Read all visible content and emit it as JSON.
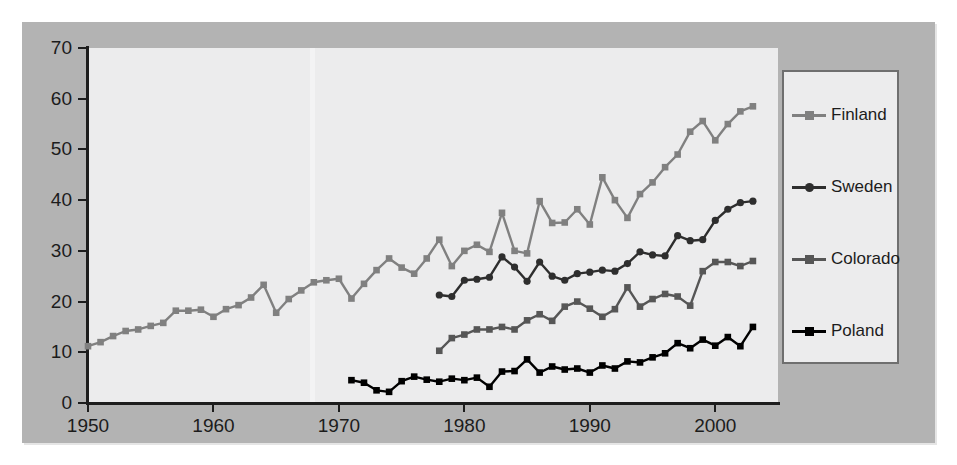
{
  "chart_data": {
    "type": "line",
    "title": "",
    "xlabel": "",
    "ylabel": "",
    "xlim": [
      1950,
      2005
    ],
    "ylim": [
      0,
      70
    ],
    "xticks": [
      1950,
      1960,
      1970,
      1980,
      1990,
      2000
    ],
    "yticks": [
      0,
      10,
      20,
      30,
      40,
      50,
      60,
      70
    ],
    "grid": false,
    "legend_position": "right",
    "colors": {
      "finland": "#808080",
      "sweden": "#2e2e2e",
      "colorado": "#565656",
      "poland": "#000000",
      "panel_background": "#ececed",
      "card_background": "#b3b3b3",
      "axis": "#1d1d1d",
      "text": "#1c1c1c"
    },
    "series": [
      {
        "name": "Finland",
        "marker": "square",
        "color": "#808080",
        "x": [
          1950,
          1951,
          1952,
          1953,
          1954,
          1955,
          1956,
          1957,
          1958,
          1959,
          1960,
          1961,
          1962,
          1963,
          1964,
          1965,
          1966,
          1967,
          1968,
          1969,
          1970,
          1971,
          1972,
          1973,
          1974,
          1975,
          1976,
          1977,
          1978,
          1979,
          1980,
          1981,
          1982,
          1983,
          1984,
          1985,
          1986,
          1987,
          1988,
          1989,
          1990,
          1991,
          1992,
          1993,
          1994,
          1995,
          1996,
          1997,
          1998,
          1999,
          2000,
          2001,
          2002,
          2003
        ],
        "values": [
          11.2,
          12.0,
          13.2,
          14.2,
          14.5,
          15.2,
          15.8,
          18.2,
          18.2,
          18.4,
          17.0,
          18.5,
          19.3,
          20.8,
          23.3,
          17.8,
          20.5,
          22.2,
          23.8,
          24.2,
          24.5,
          20.6,
          23.5,
          26.2,
          28.5,
          26.7,
          25.5,
          28.5,
          32.2,
          27.0,
          30.0,
          31.2,
          29.8,
          37.5,
          30.0,
          29.5,
          39.8,
          35.5,
          35.6,
          38.2,
          35.2,
          44.5,
          40.0,
          36.5,
          41.2,
          43.5,
          46.5,
          49.0,
          53.5,
          55.6,
          51.8,
          55.0,
          57.5,
          58.5
        ]
      },
      {
        "name": "Sweden",
        "marker": "circle",
        "color": "#2e2e2e",
        "x": [
          1978,
          1979,
          1980,
          1981,
          1982,
          1983,
          1984,
          1985,
          1986,
          1987,
          1988,
          1989,
          1990,
          1991,
          1992,
          1993,
          1994,
          1995,
          1996,
          1997,
          1998,
          1999,
          2000,
          2001,
          2002,
          2003
        ],
        "values": [
          21.3,
          21.0,
          24.2,
          24.4,
          24.8,
          28.8,
          26.8,
          24.0,
          27.8,
          25.0,
          24.2,
          25.5,
          25.8,
          26.2,
          26.0,
          27.5,
          29.8,
          29.2,
          29.0,
          33.0,
          32.0,
          32.2,
          36.0,
          38.2,
          39.5,
          39.8
        ]
      },
      {
        "name": "Colorado",
        "marker": "square",
        "color": "#565656",
        "x": [
          1978,
          1979,
          1980,
          1981,
          1982,
          1983,
          1984,
          1985,
          1986,
          1987,
          1988,
          1989,
          1990,
          1991,
          1992,
          1993,
          1994,
          1995,
          1996,
          1997,
          1998,
          1999,
          2000,
          2001,
          2002,
          2003
        ],
        "values": [
          10.3,
          12.8,
          13.5,
          14.5,
          14.5,
          15.0,
          14.5,
          16.3,
          17.5,
          16.2,
          19.0,
          20.0,
          18.6,
          17.0,
          18.5,
          22.8,
          19.0,
          20.5,
          21.5,
          21.0,
          19.2,
          26.0,
          27.8,
          27.8,
          27.0,
          28.0
        ]
      },
      {
        "name": "Poland",
        "marker": "square",
        "color": "#000000",
        "x": [
          1971,
          1972,
          1973,
          1974,
          1975,
          1976,
          1977,
          1978,
          1979,
          1980,
          1981,
          1982,
          1983,
          1984,
          1985,
          1986,
          1987,
          1988,
          1989,
          1990,
          1991,
          1992,
          1993,
          1994,
          1995,
          1996,
          1997,
          1998,
          1999,
          2000,
          2001,
          2002,
          2003
        ],
        "values": [
          4.5,
          4.0,
          2.5,
          2.2,
          4.3,
          5.2,
          4.6,
          4.2,
          4.8,
          4.5,
          5.0,
          3.2,
          6.2,
          6.3,
          8.6,
          6.0,
          7.2,
          6.6,
          6.8,
          6.0,
          7.4,
          6.8,
          8.2,
          8.0,
          9.0,
          9.8,
          11.8,
          10.8,
          12.5,
          11.3,
          13.0,
          11.2,
          15.0
        ]
      }
    ]
  },
  "legend": {
    "items": [
      {
        "label": "Finland",
        "marker": "square",
        "color": "#808080"
      },
      {
        "label": "Sweden",
        "marker": "circle",
        "color": "#2e2e2e"
      },
      {
        "label": "Colorado",
        "marker": "square",
        "color": "#565656"
      },
      {
        "label": "Poland",
        "marker": "square",
        "color": "#000000"
      }
    ]
  },
  "axes": {
    "y_tick_labels": [
      "70",
      "60",
      "50",
      "40",
      "30",
      "20",
      "10",
      "0"
    ],
    "x_tick_labels": [
      "1950",
      "1960",
      "1970",
      "1980",
      "1990",
      "2000"
    ]
  }
}
